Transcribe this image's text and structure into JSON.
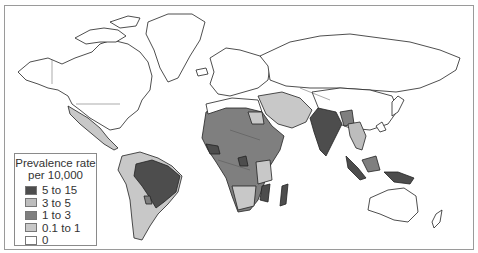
{
  "legend": {
    "title_line1": "Prevalence rate",
    "title_line2": "per 10,000",
    "items": [
      {
        "label": "5 to 15",
        "color": "#4d4d4d"
      },
      {
        "label": "3 to 5",
        "color": "#bdbdbd"
      },
      {
        "label": "1 to 3",
        "color": "#7f7f7f"
      },
      {
        "label": "0.1 to 1",
        "color": "#c8c8c8"
      },
      {
        "label": "0",
        "color": "#ffffff"
      }
    ]
  },
  "colors": {
    "outline": "#222222",
    "border": "#8a8a8a",
    "frame": "#9a9a9a"
  }
}
